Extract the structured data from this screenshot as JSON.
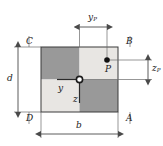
{
  "figure": {
    "colors": {
      "dark_quadrant": "#999999",
      "light_quadrant": "#e8e6e3",
      "outline": "#3a3a3a",
      "dimension_line": "#4a4a4a",
      "text": "#1a1a1a",
      "background": "#ffffff"
    },
    "corners": {
      "top_left": "C",
      "top_right": "B",
      "bottom_right": "A",
      "bottom_left": "D"
    },
    "dimensions": {
      "width_label": "b",
      "depth_label": "d",
      "point_horizontal_label": "y",
      "point_horizontal_sub": "P",
      "point_vertical_label": "z",
      "point_vertical_sub": "P"
    },
    "axes": {
      "horizontal_label": "y",
      "vertical_label": "z",
      "origin_name": "centroid"
    },
    "point": {
      "label": "P"
    }
  }
}
